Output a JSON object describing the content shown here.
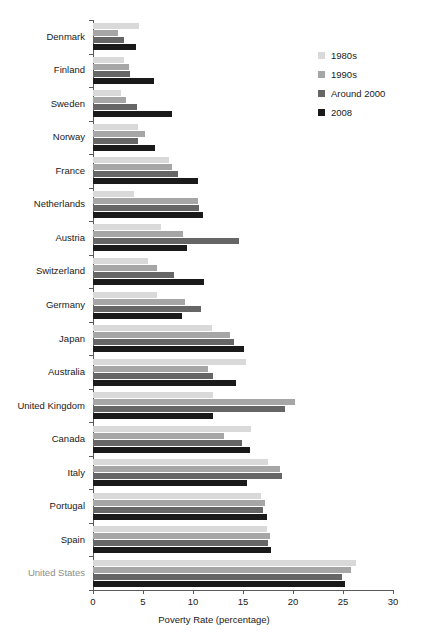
{
  "chart_data": {
    "type": "bar",
    "orientation": "horizontal",
    "title": "",
    "xlabel": "Poverty Rate (percentage)",
    "ylabel": "",
    "xlim": [
      0,
      30
    ],
    "xticks": [
      0,
      5,
      10,
      15,
      20,
      25,
      30
    ],
    "grid": false,
    "legend_position": "top-right",
    "categories": [
      "Denmark",
      "Finland",
      "Sweden",
      "Norway",
      "France",
      "Netherlands",
      "Austria",
      "Switzerland",
      "Germany",
      "Japan",
      "Australia",
      "United Kingdom",
      "Canada",
      "Italy",
      "Portugal",
      "Spain",
      "United States"
    ],
    "series": [
      {
        "name": "1980s",
        "color": "#d9d9d9",
        "values": [
          4.6,
          3.1,
          2.8,
          4.5,
          7.6,
          4.1,
          6.8,
          5.5,
          6.4,
          11.9,
          15.3,
          12.0,
          15.8,
          17.5,
          16.8,
          17.4,
          26.3
        ]
      },
      {
        "name": "1990s",
        "color": "#a6a6a6",
        "values": [
          2.5,
          3.6,
          3.3,
          5.2,
          7.9,
          10.5,
          9.0,
          6.4,
          9.2,
          13.7,
          11.5,
          20.2,
          13.1,
          18.7,
          17.2,
          17.7,
          25.8
        ]
      },
      {
        "name": "Around 2000",
        "color": "#666666",
        "values": [
          3.1,
          3.7,
          4.4,
          4.5,
          8.5,
          10.6,
          14.6,
          8.1,
          10.8,
          14.1,
          12.0,
          19.2,
          14.9,
          18.9,
          17.0,
          17.5,
          24.9
        ]
      },
      {
        "name": "2008",
        "color": "#1a1a1a",
        "values": [
          4.3,
          6.1,
          7.9,
          6.2,
          10.5,
          11.0,
          9.4,
          11.1,
          8.9,
          15.1,
          14.3,
          12.0,
          15.7,
          15.4,
          17.4,
          17.8,
          25.2
        ]
      }
    ]
  },
  "legend": {
    "items": [
      {
        "label": "1980s",
        "color": "#d9d9d9"
      },
      {
        "label": "1990s",
        "color": "#a6a6a6"
      },
      {
        "label": "Around 2000",
        "color": "#666666"
      },
      {
        "label": "2008",
        "color": "#1a1a1a"
      }
    ]
  },
  "axis": {
    "x_title": "Poverty Rate (percentage)",
    "x_tick_labels": [
      "0",
      "5",
      "10",
      "15",
      "20",
      "25",
      "30"
    ]
  },
  "highlighted_category": "United States"
}
